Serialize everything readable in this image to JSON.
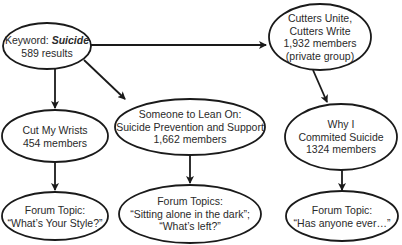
{
  "diagram": {
    "title": "",
    "colors": {
      "stroke": "#1a1a1a",
      "text": "#2a2a2a",
      "fill": "#ffffff"
    },
    "nodes": {
      "keyword": {
        "label_prefix": "Keyword: ",
        "keyword": "Suicide",
        "count": "589 results"
      },
      "cutters_unite": {
        "lines": [
          "Cutters Unite,",
          "Cutters Write",
          "1,932 members",
          "(private group)"
        ]
      },
      "cut_my_wrists": {
        "lines": [
          "Cut My Wrists",
          "454 members"
        ]
      },
      "someone_to_lean_on": {
        "lines": [
          "Someone to Lean On:",
          "Suicide Prevention and Support",
          "1,662 members"
        ]
      },
      "why_i_commited": {
        "lines": [
          "Why I",
          "Commited Suicide",
          "1324 members"
        ]
      },
      "topic_left": {
        "lines": [
          "Forum Topic:",
          "“What’s Your Style?”"
        ]
      },
      "topic_middle": {
        "lines": [
          "Forum Topics:",
          "“Sitting alone in the dark”;",
          "“What’s left?”"
        ]
      },
      "topic_right": {
        "lines": [
          "Forum Topic:",
          "“Has anyone ever…”"
        ]
      }
    },
    "edges": [
      {
        "from": "keyword",
        "to": "cutters_unite"
      },
      {
        "from": "keyword",
        "to": "cut_my_wrists"
      },
      {
        "from": "keyword",
        "to": "someone_to_lean_on"
      },
      {
        "from": "cutters_unite",
        "to": "why_i_commited"
      },
      {
        "from": "cut_my_wrists",
        "to": "topic_left"
      },
      {
        "from": "someone_to_lean_on",
        "to": "topic_middle"
      },
      {
        "from": "why_i_commited",
        "to": "topic_right"
      }
    ]
  }
}
